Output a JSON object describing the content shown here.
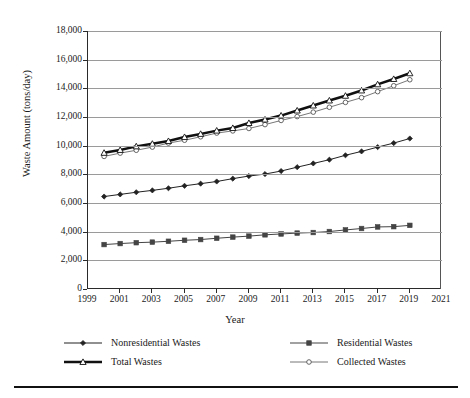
{
  "axes": {
    "ylabel": "Waste Amount (tons/day)",
    "xlabel": "Year",
    "yticks": [
      "0",
      "2,000",
      "4,000",
      "6,000",
      "8,000",
      "10,000",
      "12,000",
      "14,000",
      "16,000",
      "18,000"
    ],
    "xticks": [
      "1999",
      "2001",
      "2003",
      "2005",
      "2007",
      "2009",
      "2011",
      "2013",
      "2015",
      "2017",
      "2019",
      "2021"
    ]
  },
  "legend": {
    "items": [
      {
        "label": "Nonresidential Wastes",
        "marker": "filled-diamond-icon",
        "color": "#222222",
        "width": 1.1
      },
      {
        "label": "Residential Wastes",
        "marker": "filled-square-icon",
        "color": "#444444",
        "width": 1.1
      },
      {
        "label": "Total Wastes",
        "marker": "open-triangle-icon",
        "color": "#111111",
        "width": 2.6
      },
      {
        "label": "Collected Wastes",
        "marker": "open-circle-icon",
        "color": "#777777",
        "width": 1.0
      }
    ]
  },
  "chart_data": {
    "type": "line",
    "title": "",
    "xlabel": "Year",
    "ylabel": "Waste Amount (tons/day)",
    "xlim": [
      1999,
      2021
    ],
    "ylim": [
      0,
      18000
    ],
    "ytick_step": 2000,
    "xtick_step": 2,
    "grid": "horizontal",
    "legend_position": "below",
    "x": [
      2000,
      2001,
      2002,
      2003,
      2004,
      2005,
      2006,
      2007,
      2008,
      2009,
      2010,
      2011,
      2012,
      2013,
      2014,
      2015,
      2016,
      2017,
      2018,
      2019
    ],
    "series": [
      {
        "name": "Nonresidential Wastes",
        "marker": "filled-diamond-icon",
        "color": "#222222",
        "values": [
          6450,
          6600,
          6750,
          6880,
          7030,
          7200,
          7350,
          7500,
          7700,
          7880,
          8020,
          8230,
          8500,
          8760,
          9020,
          9330,
          9600,
          9900,
          10180,
          10500
        ]
      },
      {
        "name": "Residential Wastes",
        "marker": "filled-square-icon",
        "color": "#444444",
        "values": [
          3100,
          3170,
          3230,
          3270,
          3330,
          3400,
          3450,
          3540,
          3620,
          3690,
          3780,
          3840,
          3900,
          3940,
          4010,
          4120,
          4220,
          4330,
          4350,
          4440
        ]
      },
      {
        "name": "Total Wastes",
        "marker": "open-triangle-icon",
        "color": "#111111",
        "values": [
          9500,
          9700,
          9950,
          10130,
          10320,
          10600,
          10820,
          11050,
          11230,
          11580,
          11820,
          12100,
          12450,
          12800,
          13150,
          13480,
          13850,
          14280,
          14650,
          15050
        ]
      },
      {
        "name": "Collected Wastes",
        "marker": "open-circle-icon",
        "color": "#777777",
        "values": [
          9250,
          9480,
          9680,
          9900,
          10180,
          10380,
          10620,
          10880,
          11030,
          11200,
          11470,
          11760,
          12030,
          12340,
          12680,
          13020,
          13350,
          13770,
          14180,
          14600
        ]
      }
    ]
  }
}
